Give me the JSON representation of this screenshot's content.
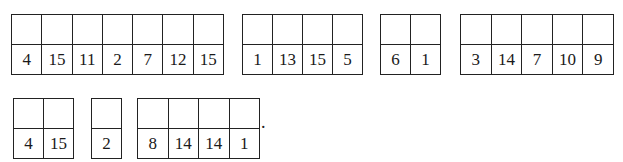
{
  "header": {
    "cut_text": ""
  },
  "rows": [
    {
      "groups": [
        {
          "values": [
            "4",
            "15",
            "11",
            "2",
            "7",
            "12",
            "15"
          ]
        },
        {
          "values": [
            "1",
            "13",
            "15",
            "5"
          ]
        },
        {
          "values": [
            "6",
            "1"
          ]
        },
        {
          "values": [
            "3",
            "14",
            "7",
            "10",
            "9"
          ]
        }
      ]
    },
    {
      "groups": [
        {
          "values": [
            "4",
            "15"
          ]
        },
        {
          "values": [
            "2"
          ]
        },
        {
          "values": [
            "8",
            "14",
            "14",
            "1"
          ]
        }
      ],
      "terminal_punctuation": "."
    }
  ]
}
